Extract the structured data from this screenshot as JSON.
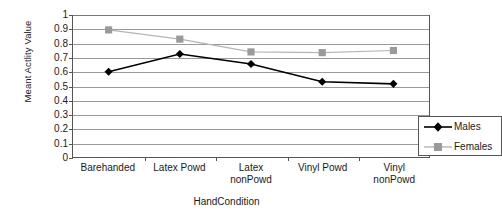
{
  "chart_data": {
    "type": "line",
    "title": "",
    "xlabel": "HandCondition",
    "ylabel": "Meant Actlity Value",
    "categories": [
      "Barehanded",
      "Latex Powd",
      "Latex\nnonPowd",
      "Vinyl Powd",
      "Vinyl nonPowd"
    ],
    "ylim": [
      0,
      1
    ],
    "yticks": [
      "1",
      "0.9",
      "0.8",
      "0.7",
      "0.6",
      "0.5",
      "0.4",
      "0.3",
      "0.2",
      "0.1",
      "0"
    ],
    "ytick_values": [
      1,
      0.9,
      0.8,
      0.7,
      0.6,
      0.5,
      0.4,
      0.3,
      0.2,
      0.1,
      0
    ],
    "grid": true,
    "legend_position": "bottom-right inside plot",
    "series": [
      {
        "name": "Males",
        "values": [
          0.6,
          0.725,
          0.655,
          0.53,
          0.515
        ],
        "color": "#000000",
        "marker": "diamond"
      },
      {
        "name": "Females",
        "values": [
          0.895,
          0.83,
          0.74,
          0.735,
          0.75
        ],
        "color": "#9a9a9a",
        "marker": "square"
      }
    ]
  },
  "legend": {
    "entries": [
      {
        "label": "Males"
      },
      {
        "label": "Females"
      }
    ]
  },
  "colors": {
    "males": "#000000",
    "females": "#9a9a9a",
    "gridline": "#9a9a9a",
    "axis": "#555555",
    "background": "#ffffff"
  }
}
